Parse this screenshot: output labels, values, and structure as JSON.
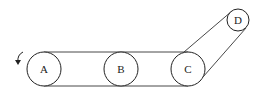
{
  "diagram": {
    "type": "belt-pulley-system",
    "pulleys": [
      {
        "label": "A",
        "cx": 44,
        "cy": 69,
        "r": 17
      },
      {
        "label": "B",
        "cx": 121,
        "cy": 69,
        "r": 17
      },
      {
        "label": "C",
        "cx": 188,
        "cy": 69,
        "r": 17
      },
      {
        "label": "D",
        "cx": 238,
        "cy": 20,
        "r": 11
      }
    ],
    "rotation_indicator": {
      "pulley": "A",
      "direction": "counterclockwise"
    },
    "belts": [
      {
        "from": "A",
        "to": "C",
        "path": "A-B-C"
      },
      {
        "from": "C",
        "to": "D"
      }
    ]
  }
}
